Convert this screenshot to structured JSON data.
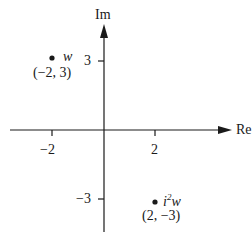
{
  "diagram": {
    "type": "complex-plane",
    "axes": {
      "x_label": "Re",
      "y_label": "Im",
      "x_ticks": [
        {
          "value": -2,
          "label": "−2"
        },
        {
          "value": 2,
          "label": "2"
        }
      ],
      "y_ticks": [
        {
          "value": 3,
          "label": "3"
        },
        {
          "value": -3,
          "label": "−3"
        }
      ]
    },
    "points": [
      {
        "name": "w",
        "x": -2,
        "y": 3,
        "label": "w",
        "coords": "(−2, 3)"
      },
      {
        "name": "i^2 w",
        "x": 2,
        "y": -3,
        "label_base": "i",
        "label_sup": "2",
        "label_tail": "w",
        "coords": "(2, −3)"
      }
    ]
  }
}
